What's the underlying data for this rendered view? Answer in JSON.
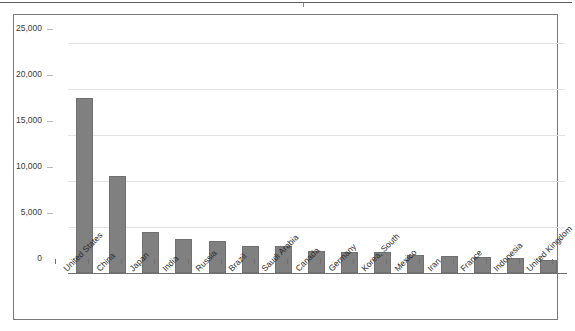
{
  "chart_data": {
    "type": "bar",
    "title": "",
    "xlabel": "",
    "ylabel": "",
    "ylim": [
      0,
      25000
    ],
    "grid": true,
    "legend": false,
    "ytick_labels": [
      "25,000",
      "20,000",
      "15,000",
      "10,000",
      "5,000",
      "0"
    ],
    "ytick_values": [
      25000,
      20000,
      15000,
      10000,
      5000,
      0
    ],
    "categories": [
      "United States",
      "China",
      "Japan",
      "India",
      "Russia",
      "Brazil",
      "Saudi Arabia",
      "Canada",
      "Germany",
      "Korea, South",
      "Mexico",
      "Iran",
      "France",
      "Indonesia",
      "United Kingdom"
    ],
    "values": [
      19000,
      10500,
      4500,
      3750,
      3500,
      2950,
      2900,
      2400,
      2300,
      2250,
      2000,
      1900,
      1750,
      1600,
      1450
    ],
    "bar_color": "#808080",
    "gridline_color": "#e2e2e2",
    "axis_color": "#6f6f6f"
  }
}
